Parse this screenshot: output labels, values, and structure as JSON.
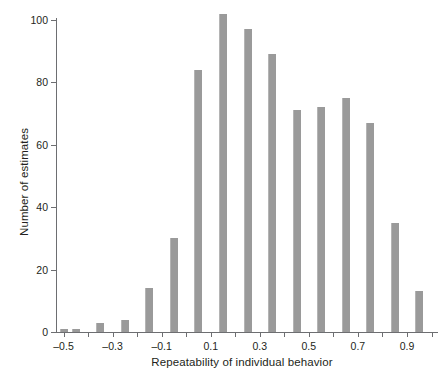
{
  "chart_data": {
    "type": "bar",
    "title": "",
    "subtitle": "",
    "xlabel": "Repeatability of individual behavior",
    "ylabel": "Number of estimates",
    "grid": false,
    "legend": null,
    "legend_position": "none",
    "bin_width": 0.05,
    "bar_color": "#9a9a9a",
    "axis_color": "#6d6e71",
    "xlim": [
      -0.525,
      1.0
    ],
    "ylim": [
      0,
      107
    ],
    "xticks": [
      "-0.5",
      "-0.3",
      "-0.1",
      "0.1",
      "0.3",
      "0.5",
      "0.7",
      "0.9"
    ],
    "xtick_values": [
      -0.5,
      -0.3,
      -0.1,
      0.1,
      0.3,
      0.5,
      0.7,
      0.9
    ],
    "yticks": [
      "0",
      "20",
      "40",
      "60",
      "80",
      "100"
    ],
    "ytick_values": [
      0,
      20,
      40,
      60,
      80,
      100
    ],
    "categories": [
      -0.5,
      -0.45,
      -0.4,
      -0.35,
      -0.3,
      -0.25,
      -0.2,
      -0.15,
      -0.1,
      -0.05,
      0.05,
      0.15,
      0.25,
      0.35,
      0.45,
      0.55,
      0.65,
      0.75,
      0.85,
      0.95
    ],
    "values": [
      1,
      1,
      0,
      3,
      0,
      4,
      0,
      14,
      0,
      30,
      84,
      102,
      97,
      89,
      71,
      72,
      75,
      67,
      35,
      13
    ],
    "bars": [
      {
        "x": -0.5,
        "value": 1
      },
      {
        "x": -0.45,
        "value": 1
      },
      {
        "x": -0.35,
        "value": 3
      },
      {
        "x": -0.25,
        "value": 4
      },
      {
        "x": -0.15,
        "value": 14
      },
      {
        "x": -0.05,
        "value": 30
      },
      {
        "x": 0.05,
        "value": 84
      },
      {
        "x": 0.15,
        "value": 102
      },
      {
        "x": 0.25,
        "value": 97
      },
      {
        "x": 0.35,
        "value": 89
      },
      {
        "x": 0.45,
        "value": 71
      },
      {
        "x": 0.55,
        "value": 72
      },
      {
        "x": 0.65,
        "value": 75
      },
      {
        "x": 0.75,
        "value": 67
      },
      {
        "x": 0.85,
        "value": 35
      },
      {
        "x": 0.95,
        "value": 13
      }
    ]
  }
}
